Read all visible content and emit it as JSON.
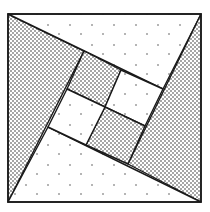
{
  "diagram": {
    "type": "pinwheel-square-dissection",
    "colors": {
      "background": "#ffffff",
      "stroke": "#1a1a1a",
      "dense_dot": "#222222",
      "sparse_dot": "#333333"
    },
    "outer_square": {
      "x": 8,
      "y": 14,
      "w": 193,
      "h": 188
    },
    "regions": [
      {
        "name": "left-dense-triangle",
        "fill": "dense",
        "points": "8,14 84,51 8,202"
      },
      {
        "name": "top-light-triangle",
        "fill": "sparse",
        "points": "8,14 201,14 163,89"
      },
      {
        "name": "right-dense-triangle",
        "fill": "dense",
        "points": "201,14 201,202 128,164"
      },
      {
        "name": "bottom-light-triangle",
        "fill": "sparse",
        "points": "201,202 8,202 48,127"
      },
      {
        "name": "inner-square-top-left-dense",
        "fill": "dense",
        "points": "84,51 121,70 105,107 67,89"
      },
      {
        "name": "inner-square-top-right-light",
        "fill": "sparse",
        "points": "121,70 163,89 145,126 105,107"
      },
      {
        "name": "inner-square-bottom-right-dense",
        "fill": "dense",
        "points": "105,107 145,126 128,164 86,145"
      },
      {
        "name": "inner-square-bottom-left-light",
        "fill": "sparse",
        "points": "67,89 105,107 86,145 48,127"
      }
    ]
  }
}
